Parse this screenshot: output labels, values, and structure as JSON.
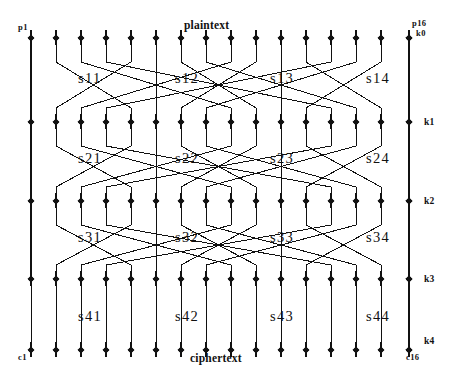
{
  "diagram": {
    "ink_color": "#111111",
    "background_color": "#ffffff",
    "bit_count": 16,
    "rounds": 4,
    "io_labels": {
      "plaintext": "plaintext",
      "ciphertext": "ciphertext",
      "first_plaintext_bit": "p1",
      "last_plaintext_bit": "p16",
      "first_ciphertext_bit": "c1",
      "last_ciphertext_bit": "c16"
    },
    "key_labels": [
      "k0",
      "k1",
      "k2",
      "k3",
      "k4"
    ],
    "sbox_rows": [
      {
        "row": 1,
        "labels": [
          "s11",
          "s12",
          "s13",
          "s14"
        ]
      },
      {
        "row": 2,
        "labels": [
          "s21",
          "s22",
          "s23",
          "s24"
        ]
      },
      {
        "row": 3,
        "labels": [
          "s31",
          "s32",
          "s33",
          "s34"
        ]
      },
      {
        "row": 4,
        "labels": [
          "s41",
          "s42",
          "s43",
          "s44"
        ]
      }
    ],
    "node_rows": [
      {
        "name": "plaintext-xor-row",
        "y": 38
      },
      {
        "name": "round1-output-row",
        "y": 122
      },
      {
        "name": "round2-output-row",
        "y": 201
      },
      {
        "name": "round3-output-row",
        "y": 279
      },
      {
        "name": "ciphertext-row",
        "y": 350
      }
    ],
    "node_x": [
      31,
      56,
      81,
      106,
      131,
      156,
      181,
      206,
      231,
      256,
      281,
      306,
      331,
      356,
      381,
      409
    ],
    "sbox_label_x": [
      78,
      175,
      270,
      366
    ],
    "sbox_label_y": [
      70,
      150,
      229,
      308
    ],
    "permutation_map": [
      0,
      4,
      8,
      12,
      1,
      5,
      9,
      13,
      2,
      6,
      10,
      14,
      3,
      7,
      11,
      15
    ]
  }
}
